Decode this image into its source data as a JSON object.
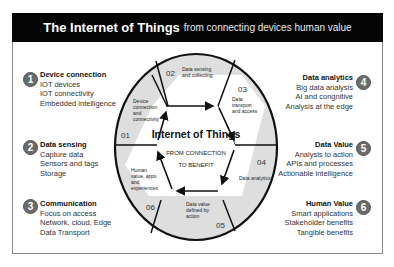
{
  "title": {
    "main": "The Internet of Things",
    "sub": "from connecting devices human value"
  },
  "left_blocks": [
    {
      "number": "1",
      "heading": "Device connection",
      "lines": [
        "IOT devices",
        "IOT connectivity",
        "Embedded intelligence"
      ]
    },
    {
      "number": "2",
      "heading": "Data sensing",
      "lines": [
        "Capture data",
        "Sensors and tags",
        "Storage"
      ]
    },
    {
      "number": "3",
      "heading": "Communication",
      "lines": [
        "Focus on access",
        "Network, cloud, Edge",
        "Data Transport"
      ]
    }
  ],
  "right_blocks": [
    {
      "number": "4",
      "heading": "Data analytics",
      "lines": [
        "Big data analysis",
        "AI and congnitive",
        "Analysis at the edge"
      ]
    },
    {
      "number": "5",
      "heading": "Data Value",
      "lines": [
        "Analysis to action",
        "APIs and processes",
        "Actionable intelligence"
      ]
    },
    {
      "number": "6",
      "heading": "Human Value",
      "lines": [
        "Smart applications",
        "Stakeholder benefits",
        "Tangible benefits"
      ]
    }
  ],
  "diagram": {
    "center_title": "Internet of Things",
    "center_sub1": "FROM CONNECTION",
    "center_sub2": "TO BENEFIT",
    "segments": [
      {
        "num": "01",
        "label": [
          "Device",
          "connection",
          "and",
          "connectivity"
        ]
      },
      {
        "num": "02",
        "label": [
          "Data sensing",
          "and collecting"
        ]
      },
      {
        "num": "03",
        "label": [
          "Data",
          "transport",
          "and access"
        ]
      },
      {
        "num": "04",
        "label": [
          "Data analytics"
        ]
      },
      {
        "num": "05",
        "label": [
          "Data value",
          "defined by",
          "action"
        ]
      },
      {
        "num": "06",
        "label": [
          "Human",
          "value, apps",
          "and",
          "experiences"
        ]
      }
    ],
    "colors": {
      "fill": "#dedede",
      "stroke": "#111111",
      "center": "#ffffff"
    }
  }
}
